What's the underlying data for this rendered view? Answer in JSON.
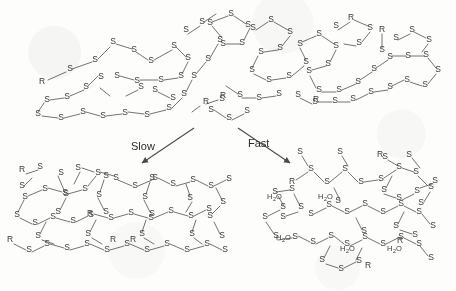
{
  "figure": {
    "type": "chemical-reaction-scheme",
    "background_color": "#fdfdfb",
    "ink_color": "#4a4a4a"
  },
  "labels": {
    "sulfur": "S",
    "organic_group": "R",
    "water": "H",
    "water_sub": "2",
    "water_tail": "O"
  },
  "pathways": [
    {
      "id": "slow",
      "label": "Slow",
      "direction": "down-left"
    },
    {
      "id": "fast",
      "label": "Fast",
      "direction": "down-right"
    }
  ],
  "panels": {
    "reactant": {
      "name": "reactant-cluster",
      "position": "top",
      "water_count": 0
    },
    "product_slow": {
      "name": "slow-product-network",
      "position": "bottom-left",
      "water_count": 0
    },
    "product_fast": {
      "name": "fast-product-network",
      "position": "bottom-right",
      "water_count": 5
    }
  },
  "water_molecules": [
    {
      "id": "w1",
      "x": 272,
      "y": 196
    },
    {
      "id": "w2",
      "x": 323,
      "y": 196
    },
    {
      "id": "w3",
      "x": 281,
      "y": 237
    },
    {
      "id": "w4",
      "x": 345,
      "y": 248
    },
    {
      "id": "w5",
      "x": 392,
      "y": 248
    }
  ]
}
